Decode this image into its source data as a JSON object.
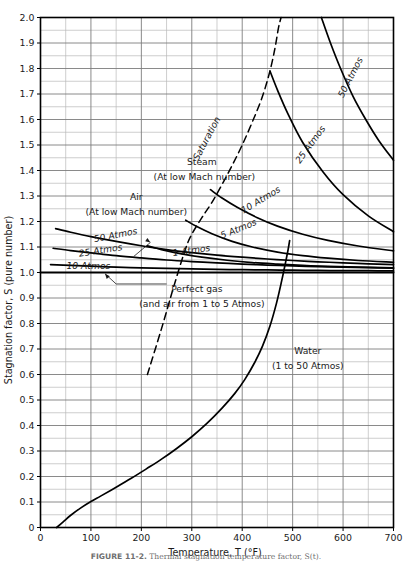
{
  "figure": {
    "caption_label": "FIGURE 11-2.",
    "caption_text": "Thermal stagnation temperature factor, S(t)."
  },
  "chart_data": {
    "type": "line",
    "title": "",
    "xlabel": "Temperature,  T (°F)",
    "ylabel": "Stagnation factor, S (pure number)",
    "xlim": [
      0,
      700
    ],
    "ylim": [
      0,
      2.0
    ],
    "xticks": [
      0,
      100,
      200,
      300,
      400,
      500,
      600,
      700
    ],
    "yticks": [
      0,
      0.1,
      0.2,
      0.3,
      0.4,
      0.5,
      0.6,
      0.7,
      0.8,
      0.9,
      1.0,
      1.1,
      1.2,
      1.3,
      1.4,
      1.5,
      1.6,
      1.7,
      1.8,
      1.9,
      2.0
    ],
    "ytick_labels": [
      "0",
      "0.1",
      "0.2",
      "0.3",
      "0.4",
      "0.5",
      "0.6",
      "0.7",
      "0.8",
      "0.9",
      "1.0",
      "1.1",
      "1.2",
      "1.3",
      "1.4",
      "1.5",
      "1.6",
      "1.7",
      "1.8",
      "1.9",
      "2.0"
    ],
    "xminor_step": 50,
    "grid": true,
    "legend_position": "inline-labels",
    "series": [
      {
        "name": "Air 50 Atmos",
        "group": "air",
        "style": "solid",
        "points": [
          [
            30,
            1.172
          ],
          [
            60,
            1.158
          ],
          [
            100,
            1.141
          ],
          [
            150,
            1.122
          ],
          [
            200,
            1.105
          ],
          [
            250,
            1.09
          ],
          [
            300,
            1.078
          ],
          [
            350,
            1.068
          ],
          [
            400,
            1.06
          ],
          [
            450,
            1.053
          ],
          [
            500,
            1.047
          ],
          [
            550,
            1.042
          ],
          [
            600,
            1.038
          ],
          [
            650,
            1.034
          ],
          [
            700,
            1.031
          ]
        ]
      },
      {
        "name": "Air 25 Atmos",
        "group": "air",
        "style": "solid",
        "points": [
          [
            25,
            1.095
          ],
          [
            60,
            1.086
          ],
          [
            100,
            1.077
          ],
          [
            150,
            1.066
          ],
          [
            200,
            1.057
          ],
          [
            250,
            1.049
          ],
          [
            300,
            1.043
          ],
          [
            350,
            1.038
          ],
          [
            400,
            1.033
          ],
          [
            450,
            1.029
          ],
          [
            500,
            1.026
          ],
          [
            550,
            1.023
          ],
          [
            600,
            1.021
          ],
          [
            650,
            1.019
          ],
          [
            700,
            1.017
          ]
        ]
      },
      {
        "name": "Air 10 Atmos",
        "group": "air",
        "style": "solid",
        "points": [
          [
            20,
            1.031
          ],
          [
            60,
            1.028
          ],
          [
            100,
            1.025
          ],
          [
            150,
            1.021
          ],
          [
            200,
            1.018
          ],
          [
            250,
            1.016
          ],
          [
            300,
            1.014
          ],
          [
            350,
            1.012
          ],
          [
            400,
            1.011
          ],
          [
            450,
            1.01
          ],
          [
            500,
            1.009
          ],
          [
            550,
            1.008
          ],
          [
            600,
            1.007
          ],
          [
            650,
            1.007
          ],
          [
            700,
            1.006
          ]
        ]
      },
      {
        "name": "Perfect gas (and air from 1 to 5 Atmos)",
        "group": "perfect-gas",
        "style": "solid",
        "points": [
          [
            0,
            1.0
          ],
          [
            700,
            1.0
          ]
        ]
      },
      {
        "name": "Steam 1 Atmos",
        "group": "steam",
        "style": "solid",
        "points": [
          [
            212,
            1.105
          ],
          [
            240,
            1.09
          ],
          [
            280,
            1.073
          ],
          [
            320,
            1.06
          ],
          [
            370,
            1.048
          ],
          [
            420,
            1.039
          ],
          [
            470,
            1.033
          ],
          [
            520,
            1.028
          ],
          [
            570,
            1.024
          ],
          [
            630,
            1.021
          ],
          [
            700,
            1.018
          ]
        ]
      },
      {
        "name": "Steam 5 Atmos",
        "group": "steam",
        "style": "solid",
        "points": [
          [
            288,
            1.205
          ],
          [
            310,
            1.18
          ],
          [
            340,
            1.152
          ],
          [
            380,
            1.122
          ],
          [
            420,
            1.1
          ],
          [
            470,
            1.08
          ],
          [
            520,
            1.066
          ],
          [
            570,
            1.056
          ],
          [
            630,
            1.047
          ],
          [
            700,
            1.04
          ]
        ]
      },
      {
        "name": "Steam 10 Atmos",
        "group": "steam",
        "style": "solid",
        "points": [
          [
            337,
            1.325
          ],
          [
            360,
            1.292
          ],
          [
            390,
            1.256
          ],
          [
            430,
            1.215
          ],
          [
            470,
            1.182
          ],
          [
            520,
            1.15
          ],
          [
            570,
            1.126
          ],
          [
            630,
            1.104
          ],
          [
            700,
            1.085
          ]
        ]
      },
      {
        "name": "Steam 25 Atmos",
        "group": "steam",
        "style": "solid",
        "points": [
          [
            455,
            1.79
          ],
          [
            470,
            1.715
          ],
          [
            490,
            1.625
          ],
          [
            520,
            1.51
          ],
          [
            560,
            1.395
          ],
          [
            600,
            1.305
          ],
          [
            650,
            1.222
          ],
          [
            700,
            1.16
          ]
        ]
      },
      {
        "name": "Steam 50 Atmos",
        "group": "steam",
        "style": "solid",
        "points": [
          [
            557,
            2.0
          ],
          [
            575,
            1.9
          ],
          [
            595,
            1.8
          ],
          [
            620,
            1.69
          ],
          [
            645,
            1.6
          ],
          [
            670,
            1.52
          ],
          [
            700,
            1.44
          ]
        ]
      },
      {
        "name": "Saturation",
        "group": "saturation",
        "style": "dashed",
        "points": [
          [
            212,
            0.6
          ],
          [
            240,
            0.78
          ],
          [
            265,
            0.95
          ],
          [
            288,
            1.095
          ],
          [
            300,
            1.15
          ],
          [
            320,
            1.215
          ],
          [
            340,
            1.275
          ],
          [
            360,
            1.345
          ],
          [
            380,
            1.42
          ],
          [
            400,
            1.5
          ],
          [
            420,
            1.59
          ],
          [
            440,
            1.69
          ],
          [
            455,
            1.79
          ],
          [
            465,
            1.88
          ],
          [
            472,
            1.96
          ],
          [
            477,
            2.0
          ]
        ]
      },
      {
        "name": "Water (1 to 50 Atmos)",
        "group": "water",
        "style": "solid",
        "points": [
          [
            32,
            0.0
          ],
          [
            45,
            0.022
          ],
          [
            60,
            0.048
          ],
          [
            80,
            0.077
          ],
          [
            100,
            0.102
          ],
          [
            120,
            0.124
          ],
          [
            150,
            0.158
          ],
          [
            180,
            0.193
          ],
          [
            210,
            0.23
          ],
          [
            240,
            0.268
          ],
          [
            270,
            0.31
          ],
          [
            300,
            0.356
          ],
          [
            330,
            0.408
          ],
          [
            360,
            0.468
          ],
          [
            385,
            0.525
          ],
          [
            405,
            0.58
          ],
          [
            425,
            0.648
          ],
          [
            440,
            0.71
          ],
          [
            455,
            0.79
          ],
          [
            468,
            0.88
          ],
          [
            478,
            0.965
          ],
          [
            486,
            1.04
          ],
          [
            491,
            1.09
          ],
          [
            494,
            1.125
          ]
        ]
      }
    ],
    "annotations": [
      {
        "id": "air-title",
        "text": "Air",
        "x": 190,
        "y": 1.285
      },
      {
        "id": "air-subtitle",
        "text": "(At low Mach number)",
        "x": 190,
        "y": 1.225
      },
      {
        "id": "label-air-50",
        "text": "50 Atmos",
        "x": 150,
        "y": 1.135,
        "rotation": -11
      },
      {
        "id": "label-air-25",
        "text": "25 Atmos",
        "x": 120,
        "y": 1.075,
        "rotation": -9
      },
      {
        "id": "label-air-10",
        "text": "10 Atmos",
        "x": 95,
        "y": 1.012,
        "rotation": 0
      },
      {
        "id": "label-perfect-gas-1",
        "text": "Perfect gas",
        "x": 310,
        "y": 0.925
      },
      {
        "id": "label-perfect-gas-2",
        "text": "(and air from 1 to 5 Atmos)",
        "x": 320,
        "y": 0.865
      },
      {
        "id": "label-steam-1",
        "text": "1 Atmos",
        "x": 300,
        "y": 1.075,
        "rotation": -8
      },
      {
        "id": "label-steam-5",
        "text": "5 Atmos",
        "x": 395,
        "y": 1.16,
        "rotation": -22
      },
      {
        "id": "label-steam-10",
        "text": "10 Atmos",
        "x": 440,
        "y": 1.275,
        "rotation": -31
      },
      {
        "id": "label-steam-25",
        "text": "25 Atmos",
        "x": 540,
        "y": 1.495,
        "rotation": -54
      },
      {
        "id": "label-steam-50",
        "text": "50 Atmos",
        "x": 620,
        "y": 1.76,
        "rotation": -63
      },
      {
        "id": "label-saturation",
        "text": "Saturation",
        "x": 335,
        "y": 1.52,
        "rotation": -62
      },
      {
        "id": "steam-title",
        "text": "Steam",
        "x": 320,
        "y": 1.42
      },
      {
        "id": "steam-subtitle",
        "text": "(At low Mach number)",
        "x": 325,
        "y": 1.362
      },
      {
        "id": "water-title",
        "text": "Water",
        "x": 530,
        "y": 0.68
      },
      {
        "id": "water-subtitle",
        "text": "(1 to 50 Atmos)",
        "x": 530,
        "y": 0.62
      }
    ],
    "colors": {
      "curve": "#000000",
      "grid": "#7d7d7d",
      "minor_grid": "#b9b9b9",
      "axis": "#000000",
      "text": "#1a1a1a",
      "background": "#ffffff"
    }
  }
}
